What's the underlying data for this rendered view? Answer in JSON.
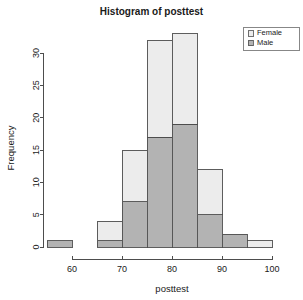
{
  "chart_data": {
    "type": "bar",
    "title": "Histogram of posttest",
    "xlabel": "posttest",
    "ylabel": "Frequency",
    "xlim": [
      55,
      100
    ],
    "ylim": [
      0,
      33
    ],
    "xticks": [
      60,
      70,
      80,
      90,
      100
    ],
    "yticks": [
      0,
      5,
      10,
      15,
      20,
      25,
      30
    ],
    "grid": false,
    "stacked": true,
    "bin_width": 5,
    "bin_edges": [
      55,
      60,
      65,
      70,
      75,
      80,
      85,
      90,
      95,
      100
    ],
    "categories": [
      "55-60",
      "60-65",
      "65-70",
      "70-75",
      "75-80",
      "80-85",
      "85-90",
      "90-95",
      "95-100"
    ],
    "series": [
      {
        "name": "Male",
        "color": "#b3b3b3",
        "values": [
          1,
          0,
          1,
          7,
          17,
          19,
          5,
          2,
          0
        ]
      },
      {
        "name": "Female",
        "color": "#ececec",
        "values": [
          0,
          0,
          3,
          8,
          15,
          14,
          7,
          0,
          1
        ]
      }
    ],
    "totals": [
      1,
      0,
      4,
      15,
      32,
      33,
      12,
      2,
      1
    ],
    "legend_position": "top-right",
    "legend_entries": [
      {
        "label": "Female",
        "color": "#ececec"
      },
      {
        "label": "Male",
        "color": "#b3b3b3"
      }
    ]
  },
  "axes": {
    "x_tick_labels": [
      "60",
      "70",
      "80",
      "90",
      "100"
    ],
    "y_tick_labels": [
      "0",
      "5",
      "10",
      "15",
      "20",
      "25",
      "30"
    ]
  },
  "colors": {
    "female_fill": "#ececec",
    "male_fill": "#b3b3b3",
    "stroke": "#4d4d4d",
    "text": "#1a1a1a",
    "background": "#ffffff"
  }
}
